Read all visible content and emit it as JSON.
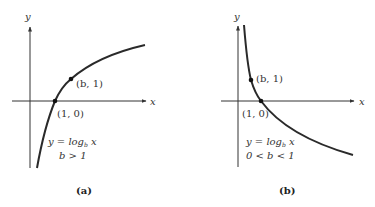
{
  "colors": {
    "axis": "#333333",
    "curve": "#2a2a2a",
    "text": "#333333",
    "background": "#ffffff"
  },
  "panels": [
    {
      "id": "a",
      "caption": "(a)",
      "axis_x_label": "x",
      "axis_y_label": "y",
      "point_b1_label": "(b, 1)",
      "point_10_label": "(1, 0)",
      "formula_prefix": "y = log",
      "formula_base": "b",
      "formula_var": " x",
      "condition": "b > 1",
      "curve_description": "increasing logarithmic curve"
    },
    {
      "id": "b",
      "caption": "(b)",
      "axis_x_label": "x",
      "axis_y_label": "y",
      "point_b1_label": "(b, 1)",
      "point_10_label": "(1, 0)",
      "formula_prefix": "y = log",
      "formula_base": "b",
      "formula_var": " x",
      "condition": "0 < b < 1",
      "curve_description": "decreasing logarithmic curve"
    }
  ]
}
